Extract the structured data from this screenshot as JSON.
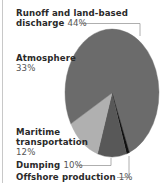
{
  "chart_data": {
    "type": "pie",
    "title": "",
    "categories": [
      "Runoff and land-based discharge",
      "Offshore production",
      "Dumping",
      "Maritime transportation",
      "Atmosphere"
    ],
    "values": [
      44,
      1,
      10,
      12,
      33
    ],
    "colors": [
      "#6b6b6b",
      "#111111",
      "#585858",
      "#b0b0b0",
      "#6b6b6b"
    ],
    "labels": [
      {
        "name_line1": "Runoff and land-based",
        "name_line2": "discharge",
        "pct": "44%"
      },
      {
        "name_line1": "Atmosphere",
        "pct": "33%"
      },
      {
        "name_line1": "Maritime",
        "name_line2": "transportation",
        "pct": "12%"
      },
      {
        "name_line1": "Dumping",
        "pct": "10%"
      },
      {
        "name_line1": "Offshore production",
        "pct": "1%"
      }
    ],
    "start_angle_deg": 0,
    "direction": "clockwise",
    "leader_color": "#9a9a9a"
  }
}
